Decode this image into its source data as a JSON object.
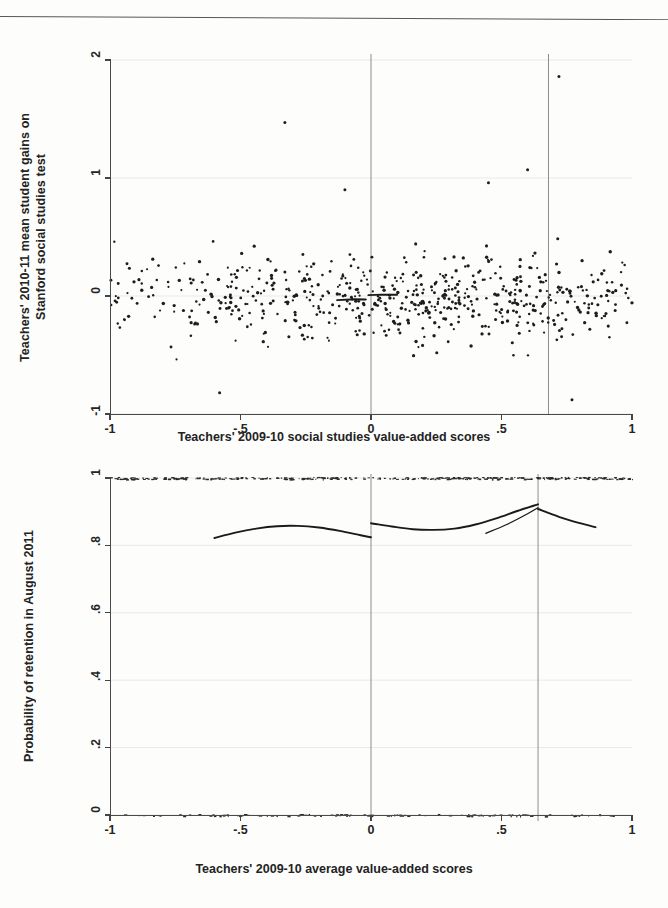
{
  "document": {
    "kind": "scanned-figure-page",
    "background_color": "#fdfdfc",
    "ink_color": "#1d1d1d"
  },
  "chart_data": [
    {
      "id": "top",
      "type": "scatter",
      "title": "",
      "xlabel": "Teachers' 2009-10 social studies value-added scores",
      "ylabel": "Teachers' 2010-11 mean student gains on\nStanford social studies test",
      "xlim": [
        -1,
        1
      ],
      "ylim": [
        -1,
        2
      ],
      "xticks": [
        "-1",
        "-.5",
        "0",
        ".5",
        "1"
      ],
      "xtick_values": [
        -1,
        -0.5,
        0,
        0.5,
        1
      ],
      "yticks": [
        "2",
        "1",
        "0",
        "-1"
      ],
      "ytick_values": [
        2,
        1,
        0,
        -1
      ],
      "grid": true,
      "grid_axis": "y",
      "legend": "none",
      "reference_lines": [
        {
          "name": "cutoff-zero",
          "x": 0
        },
        {
          "name": "cutoff-upper",
          "x": 0.68
        }
      ],
      "n_points": 620,
      "point_cloud": {
        "x_range": [
          -1.0,
          1.0
        ],
        "y_center": -0.02,
        "y_spread": 0.18,
        "density_note": "denser near x=0 to x=0.6, sparse tails"
      },
      "fit_segments": [
        {
          "name": "local-fit-left",
          "points": [
            [
              -0.13,
              -0.035
            ],
            [
              -0.06,
              -0.028
            ],
            [
              -0.02,
              -0.03
            ]
          ]
        },
        {
          "name": "local-fit-right",
          "points": [
            [
              -0.01,
              0.008
            ],
            [
              0.04,
              0.012
            ],
            [
              0.1,
              0.01
            ]
          ]
        }
      ],
      "outliers": [
        {
          "x": -0.33,
          "y": 1.47
        },
        {
          "x": 0.72,
          "y": 1.86
        },
        {
          "x": 0.6,
          "y": 1.07
        },
        {
          "x": 0.45,
          "y": 0.96
        },
        {
          "x": -0.1,
          "y": 0.9
        },
        {
          "x": -0.58,
          "y": -0.82
        },
        {
          "x": 0.77,
          "y": -0.88
        }
      ]
    },
    {
      "id": "bottom",
      "type": "line",
      "title": "",
      "xlabel": "Teachers' 2009-10 average value-added scores",
      "ylabel": "Probability of retention in August 2011",
      "xlim": [
        -1,
        1
      ],
      "ylim": [
        0,
        1
      ],
      "xticks": [
        "-1",
        "-.5",
        "0",
        ".5",
        "1"
      ],
      "xtick_values": [
        -1,
        -0.5,
        0,
        0.5,
        1
      ],
      "yticks": [
        "1",
        ".8",
        ".6",
        ".4",
        ".2",
        "0"
      ],
      "ytick_values": [
        1,
        0.8,
        0.6,
        0.4,
        0.2,
        0
      ],
      "grid": true,
      "grid_axis": "y",
      "legend": "none",
      "reference_lines": [
        {
          "name": "cutoff-zero",
          "x": 0
        },
        {
          "name": "cutoff-upper",
          "x": 0.64
        }
      ],
      "series": [
        {
          "name": "fit-left-of-zero",
          "x": [
            -0.6,
            -0.52,
            -0.44,
            -0.36,
            -0.28,
            -0.2,
            -0.12,
            -0.04,
            0.0
          ],
          "values": [
            0.822,
            0.838,
            0.85,
            0.857,
            0.858,
            0.853,
            0.843,
            0.83,
            0.824
          ]
        },
        {
          "name": "fit-right-of-zero",
          "x": [
            0.0,
            0.08,
            0.16,
            0.24,
            0.32,
            0.4,
            0.48,
            0.56,
            0.64
          ],
          "values": [
            0.866,
            0.856,
            0.848,
            0.846,
            0.85,
            0.862,
            0.88,
            0.902,
            0.922
          ]
        },
        {
          "name": "fit-secondary-rise",
          "x": [
            0.44,
            0.52,
            0.6,
            0.64
          ],
          "values": [
            0.836,
            0.862,
            0.894,
            0.912
          ]
        },
        {
          "name": "fit-right-of-cutoff",
          "x": [
            0.64,
            0.72,
            0.8,
            0.86
          ],
          "values": [
            0.908,
            0.885,
            0.866,
            0.854
          ]
        }
      ],
      "rugs": [
        {
          "name": "retained-rug",
          "y": 1.0,
          "x_range": [
            -1.0,
            1.0
          ],
          "n": 330
        },
        {
          "name": "not-retained-rug",
          "y": 0.0,
          "x_range": [
            -0.95,
            0.98
          ],
          "n": 120
        }
      ]
    }
  ]
}
